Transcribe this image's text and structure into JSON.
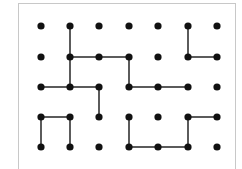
{
  "diagram": {
    "type": "dot-grid-puzzle",
    "columns": 7,
    "rows": 5,
    "column_x": [
      41,
      70,
      99,
      129,
      158,
      188,
      217
    ],
    "row_y": [
      26,
      57,
      87,
      117,
      147
    ],
    "dot_radius": 3.6,
    "line_width": 1.6,
    "colors": {
      "dot": "#111111",
      "line": "#333333",
      "frame": "#c8c8c8",
      "background": "#ffffff"
    },
    "segments": [
      {
        "from": [
          2,
          1
        ],
        "to": [
          2,
          2
        ]
      },
      {
        "from": [
          2,
          2
        ],
        "to": [
          2,
          3
        ]
      },
      {
        "from": [
          2,
          2
        ],
        "to": [
          3,
          2
        ]
      },
      {
        "from": [
          3,
          2
        ],
        "to": [
          4,
          2
        ]
      },
      {
        "from": [
          4,
          2
        ],
        "to": [
          4,
          3
        ]
      },
      {
        "from": [
          4,
          3
        ],
        "to": [
          5,
          3
        ]
      },
      {
        "from": [
          5,
          3
        ],
        "to": [
          6,
          3
        ]
      },
      {
        "from": [
          6,
          1
        ],
        "to": [
          6,
          2
        ]
      },
      {
        "from": [
          6,
          2
        ],
        "to": [
          7,
          2
        ]
      },
      {
        "from": [
          1,
          3
        ],
        "to": [
          2,
          3
        ]
      },
      {
        "from": [
          2,
          3
        ],
        "to": [
          3,
          3
        ]
      },
      {
        "from": [
          3,
          3
        ],
        "to": [
          3,
          4
        ]
      },
      {
        "from": [
          1,
          4
        ],
        "to": [
          2,
          4
        ]
      },
      {
        "from": [
          1,
          4
        ],
        "to": [
          1,
          5
        ]
      },
      {
        "from": [
          2,
          4
        ],
        "to": [
          2,
          5
        ]
      },
      {
        "from": [
          4,
          4
        ],
        "to": [
          4,
          5
        ]
      },
      {
        "from": [
          4,
          5
        ],
        "to": [
          5,
          5
        ]
      },
      {
        "from": [
          5,
          5
        ],
        "to": [
          6,
          5
        ]
      },
      {
        "from": [
          6,
          5
        ],
        "to": [
          6,
          4
        ]
      },
      {
        "from": [
          6,
          4
        ],
        "to": [
          7,
          4
        ]
      }
    ]
  }
}
